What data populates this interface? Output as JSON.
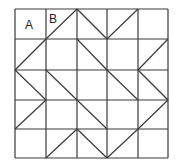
{
  "diagram": {
    "grid": {
      "cols": 5,
      "rows": 5,
      "x_lines": [
        15,
        46,
        77,
        107,
        138,
        168
      ],
      "y_lines": [
        9,
        39,
        70,
        100,
        129,
        158
      ],
      "line_color": "#3a3a3a"
    },
    "labels": [
      {
        "text": "A",
        "cell": [
          0,
          0
        ],
        "x": 25,
        "y": 19
      },
      {
        "text": "B",
        "cell": [
          1,
          0
        ],
        "x": 49,
        "y": 13
      }
    ],
    "diagonals": [
      {
        "from": [
          1,
          1
        ],
        "to": [
          2,
          0
        ]
      },
      {
        "from": [
          2,
          0
        ],
        "to": [
          3,
          1
        ]
      },
      {
        "from": [
          3,
          1
        ],
        "to": [
          4,
          0
        ]
      },
      {
        "from": [
          0,
          2
        ],
        "to": [
          1,
          1
        ]
      },
      {
        "from": [
          2,
          1
        ],
        "to": [
          3,
          2
        ]
      },
      {
        "from": [
          4,
          2
        ],
        "to": [
          5,
          1
        ]
      },
      {
        "from": [
          0,
          2
        ],
        "to": [
          1,
          3
        ]
      },
      {
        "from": [
          1,
          2
        ],
        "to": [
          2,
          3
        ]
      },
      {
        "from": [
          3,
          2
        ],
        "to": [
          4,
          3
        ]
      },
      {
        "from": [
          4,
          2
        ],
        "to": [
          5,
          3
        ]
      },
      {
        "from": [
          0,
          4
        ],
        "to": [
          1,
          3
        ]
      },
      {
        "from": [
          2,
          3
        ],
        "to": [
          3,
          4
        ]
      },
      {
        "from": [
          4,
          4
        ],
        "to": [
          5,
          3
        ]
      },
      {
        "from": [
          1,
          5
        ],
        "to": [
          2,
          4
        ]
      },
      {
        "from": [
          2,
          4
        ],
        "to": [
          3,
          5
        ]
      },
      {
        "from": [
          3,
          5
        ],
        "to": [
          4,
          4
        ]
      }
    ]
  }
}
